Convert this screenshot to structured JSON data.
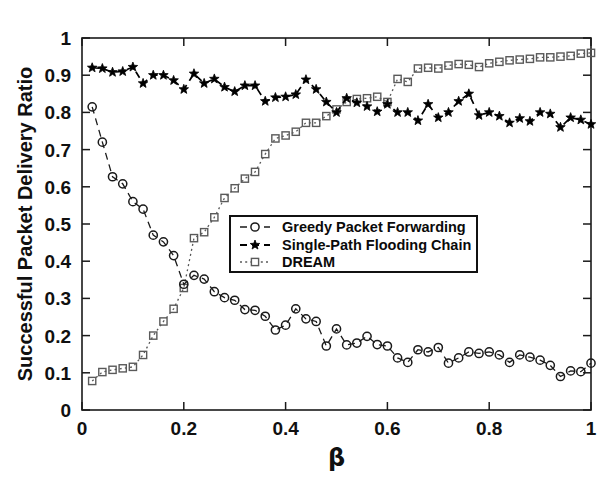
{
  "chart_data": {
    "type": "line",
    "title": "",
    "xlabel": "β",
    "ylabel": "Successful Packet Delivery Ratio",
    "xlim": [
      0,
      1
    ],
    "ylim": [
      0,
      1
    ],
    "xticks": [
      0,
      0.2,
      0.4,
      0.6,
      0.8,
      1
    ],
    "xticklabels": [
      "0",
      "0.2",
      "0.4",
      "0.6",
      "0.8",
      "1"
    ],
    "yticks": [
      0,
      0.1,
      0.2,
      0.3,
      0.4,
      0.5,
      0.6,
      0.7,
      0.8,
      0.9,
      1
    ],
    "yticklabels": [
      "0",
      "0.1",
      "0.2",
      "0.3",
      "0.4",
      "0.5",
      "0.6",
      "0.7",
      "0.8",
      "0.9",
      "1"
    ],
    "grid": false,
    "legend_position": "center",
    "x": [
      0.02,
      0.04,
      0.06,
      0.08,
      0.1,
      0.12,
      0.14,
      0.16,
      0.18,
      0.2,
      0.22,
      0.24,
      0.26,
      0.28,
      0.3,
      0.32,
      0.34,
      0.36,
      0.38,
      0.4,
      0.42,
      0.44,
      0.46,
      0.48,
      0.5,
      0.52,
      0.54,
      0.56,
      0.58,
      0.6,
      0.62,
      0.64,
      0.66,
      0.68,
      0.7,
      0.72,
      0.74,
      0.76,
      0.78,
      0.8,
      0.82,
      0.84,
      0.86,
      0.88,
      0.9,
      0.92,
      0.94,
      0.96,
      0.98,
      1.0
    ],
    "series": [
      {
        "name": "Greedy Packet Forwarding",
        "marker": "circle-open",
        "linestyle": "dashed",
        "color": "#1a1a1a",
        "values": [
          0.815,
          0.72,
          0.627,
          0.608,
          0.56,
          0.54,
          0.47,
          0.452,
          0.415,
          0.338,
          0.362,
          0.352,
          0.318,
          0.302,
          0.295,
          0.27,
          0.268,
          0.252,
          0.215,
          0.228,
          0.272,
          0.245,
          0.238,
          0.172,
          0.218,
          0.175,
          0.18,
          0.198,
          0.176,
          0.172,
          0.14,
          0.128,
          0.162,
          0.156,
          0.168,
          0.126,
          0.14,
          0.156,
          0.152,
          0.156,
          0.148,
          0.128,
          0.148,
          0.142,
          0.134,
          0.12,
          0.09,
          0.105,
          0.103,
          0.126
        ]
      },
      {
        "name": "Single-Path Flooding Chain",
        "marker": "star-filled",
        "linestyle": "dashed",
        "color": "#000000",
        "values": [
          0.92,
          0.918,
          0.908,
          0.91,
          0.922,
          0.878,
          0.9,
          0.9,
          0.886,
          0.862,
          0.904,
          0.878,
          0.89,
          0.868,
          0.856,
          0.872,
          0.872,
          0.83,
          0.84,
          0.842,
          0.848,
          0.888,
          0.862,
          0.828,
          0.8,
          0.838,
          0.826,
          0.816,
          0.802,
          0.822,
          0.8,
          0.8,
          0.778,
          0.822,
          0.786,
          0.8,
          0.83,
          0.85,
          0.792,
          0.8,
          0.79,
          0.772,
          0.784,
          0.776,
          0.8,
          0.796,
          0.76,
          0.786,
          0.78,
          0.768
        ]
      },
      {
        "name": "DREAM",
        "marker": "square-open",
        "linestyle": "dotted",
        "color": "#5a5a5a",
        "values": [
          0.078,
          0.102,
          0.108,
          0.112,
          0.116,
          0.148,
          0.2,
          0.238,
          0.272,
          0.328,
          0.462,
          0.478,
          0.518,
          0.57,
          0.596,
          0.622,
          0.64,
          0.688,
          0.73,
          0.738,
          0.748,
          0.772,
          0.772,
          0.79,
          0.808,
          0.828,
          0.836,
          0.838,
          0.842,
          0.828,
          0.89,
          0.882,
          0.918,
          0.92,
          0.918,
          0.926,
          0.93,
          0.928,
          0.922,
          0.932,
          0.936,
          0.94,
          0.942,
          0.944,
          0.948,
          0.948,
          0.95,
          0.952,
          0.958,
          0.96
        ]
      }
    ]
  },
  "legend": {
    "entries": [
      {
        "label": "Greedy Packet Forwarding"
      },
      {
        "label": "Single-Path Flooding Chain"
      },
      {
        "label": "DREAM"
      }
    ]
  }
}
